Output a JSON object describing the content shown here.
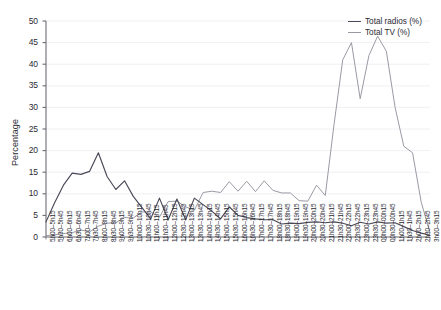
{
  "chart_data": {
    "type": "line",
    "title": "",
    "xlabel": "",
    "ylabel": "Percentage",
    "ylim": [
      0,
      50
    ],
    "ytick_step": 5,
    "yticks": [
      0,
      5,
      10,
      15,
      20,
      25,
      30,
      35,
      40,
      45,
      50
    ],
    "grid": true,
    "legend_position": "top-right",
    "colors": {
      "radio": "#4a4a58",
      "tv": "#9a9aa5",
      "axis": "#6b6b75",
      "grid": "#ececf1",
      "text": "#2b2b33"
    },
    "categories": [
      "5h00–5h15",
      "5h30–5h45",
      "6h00–6h15",
      "6h30–6h45",
      "7h00–7h15",
      "7h30–7h45",
      "8h00–8h15",
      "8h30–8h45",
      "9h00–9h15",
      "9h30–9h45",
      "10h00–10h15",
      "10h30–10h45",
      "11h00–11h15",
      "11h30–11h45",
      "12h00–12h15",
      "12h30–12h45",
      "13h00–13h15",
      "13h30–13h45",
      "14h00–14h15",
      "14h30–14h45",
      "15h00–15h15",
      "15h30–15h45",
      "16h00–16h15",
      "16h30–16h45",
      "17h00–17h15",
      "17h30–17h45",
      "18h00–18h15",
      "18h30–18h45",
      "19h00–19h15",
      "19h30–19h45",
      "20h00–20h15",
      "20h30–20h45",
      "21h00–21h15",
      "21h30–21h45",
      "22h00–22h15",
      "22h30–22h45",
      "23h00–23h15",
      "23h30–23h45",
      "00h00–00h15",
      "00h30–00h45",
      "1h00–1h15",
      "1h30–1h45",
      "2h00–2h15",
      "2h30–2h45",
      "3h00–3h15"
    ],
    "series": [
      {
        "name": "Total radios (%)",
        "color": "#4a4a58",
        "values": [
          3.5,
          8.0,
          12.0,
          14.8,
          14.5,
          15.2,
          19.5,
          14.0,
          11.0,
          13.0,
          9.4,
          6.8,
          4.2,
          9.0,
          4.0,
          8.8,
          4.0,
          9.0,
          7.5,
          6.0,
          4.2,
          7.0,
          5.0,
          4.5,
          4.2,
          4.0,
          4.0,
          3.0,
          3.2,
          3.1,
          3.4,
          3.5,
          3.3,
          3.5,
          3.2,
          2.6,
          3.4,
          3.0,
          3.5,
          3.2,
          3.3,
          2.4,
          1.5,
          0.9,
          0.4
        ]
      },
      {
        "name": "Total TV (%)",
        "color": "#9a9aa5",
        "values": [
          0.3,
          0.5,
          0.8,
          1.0,
          1.6,
          1.2,
          2.5,
          3.2,
          3.3,
          4.5,
          4.4,
          5.8,
          5.8,
          4.6,
          8.2,
          8.3,
          7.0,
          6.2,
          10.3,
          10.6,
          10.3,
          12.8,
          10.6,
          12.9,
          10.5,
          13.0,
          10.8,
          10.2,
          10.2,
          8.4,
          8.3,
          12.0,
          9.6,
          26.0,
          41.0,
          45.0,
          32.0,
          42.0,
          46.5,
          43.0,
          30.0,
          21.0,
          19.5,
          8.0,
          1.0
        ]
      }
    ]
  },
  "legend": {
    "items": [
      {
        "label": "Total radios (%)"
      },
      {
        "label": "Total TV (%)"
      }
    ]
  }
}
